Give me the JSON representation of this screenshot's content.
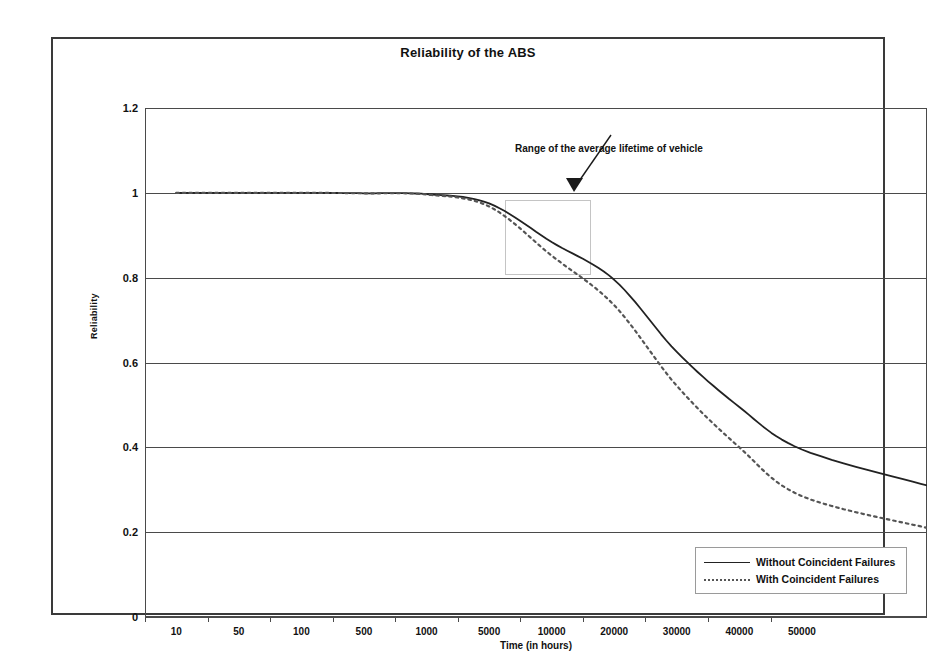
{
  "chart_data": {
    "type": "line",
    "title": "Reliability of the ABS",
    "xlabel": "Time (in hours)",
    "ylabel": "Reliability",
    "categories": [
      "10",
      "50",
      "100",
      "500",
      "1000",
      "5000",
      "10000",
      "20000",
      "30000",
      "40000",
      "50000"
    ],
    "x_tick_labels": [
      "10",
      "50",
      "100",
      "500",
      "1000",
      "5000",
      "10000",
      "20000",
      "30000",
      "40000",
      "50000"
    ],
    "y_tick_labels": [
      "0",
      "0.2",
      "0.4",
      "0.6",
      "0.8",
      "1",
      "1.2"
    ],
    "y_ticks": [
      0,
      0.2,
      0.4,
      0.6,
      0.8,
      1,
      1.2
    ],
    "ylim": [
      0,
      1.2
    ],
    "grid": true,
    "legend_position": "lower right",
    "series": [
      {
        "name": "Without Coincident Failures",
        "style": "solid",
        "color": "#222222",
        "values": [
          1.0,
          1.0,
          1.0,
          0.999,
          0.997,
          0.975,
          0.884,
          0.795,
          0.625,
          0.495,
          0.395
        ]
      },
      {
        "name": "With Coincident Failures",
        "style": "dotted",
        "color": "#555555",
        "values": [
          1.0,
          1.0,
          1.0,
          0.999,
          0.996,
          0.968,
          0.852,
          0.735,
          0.545,
          0.4,
          0.285
        ]
      }
    ],
    "series_end_values": {
      "without_coincident_failures": 0.31,
      "with_coincident_failures": 0.21
    },
    "annotations": [
      {
        "text": "Range of the average lifetime of vehicle",
        "kind": "arrow-label",
        "points_to_x": "5000-12000",
        "points_to_y": 1.0
      }
    ],
    "highlight_region": {
      "label": "Range of the average lifetime of vehicle",
      "x_start": "5000",
      "x_end": "12000",
      "y_top": 0.98,
      "y_bottom": 0.8,
      "border_color": "#bdbdbd"
    }
  },
  "legend": {
    "items": [
      {
        "label": "Without Coincident Failures",
        "style": "solid"
      },
      {
        "label": "With Coincident Failures",
        "style": "dotted"
      }
    ]
  },
  "axes": {
    "y_labels": [
      "1.2",
      "1",
      "0.8",
      "0.6",
      "0.4",
      "0.2",
      "0"
    ],
    "y_title": "Reliability",
    "x_title": "Time (in hours)",
    "x_labels": [
      "10",
      "50",
      "100",
      "500",
      "1000",
      "5000",
      "10000",
      "20000",
      "30000",
      "40000",
      "50000"
    ]
  },
  "annotation": {
    "range_label": "Range of the average lifetime of vehicle"
  }
}
